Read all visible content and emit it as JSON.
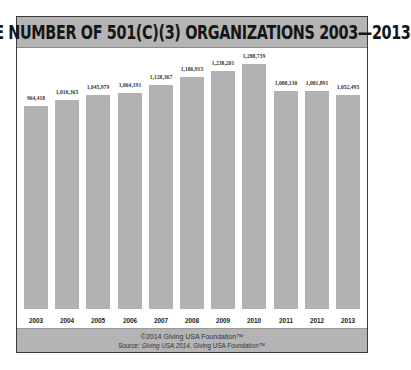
{
  "title": "THE NUMBER OF 501(C)(3) ORGANIZATIONS 2003—2013",
  "footer": {
    "copyright": "©2014 Giving USA Foundation™",
    "source_prefix": "Source: ",
    "source_italic": "Giving USA 2014",
    "source_suffix": ", Giving USA Foundation™"
  },
  "colors": {
    "bar": "#b2b2b2",
    "band": "#b4b4b4",
    "border": "#3a3a3a"
  },
  "chart_data": {
    "type": "bar",
    "title": "THE NUMBER OF 501(C)(3) ORGANIZATIONS 2003—2013",
    "xlabel": "",
    "ylabel": "",
    "categories": [
      "2003",
      "2004",
      "2005",
      "2006",
      "2007",
      "2008",
      "2009",
      "2010",
      "2011",
      "2012",
      "2013"
    ],
    "values": [
      964418,
      1010365,
      1045979,
      1064191,
      1128367,
      1186915,
      1238201,
      1288739,
      1080130,
      1081891,
      1052495
    ],
    "labels": [
      "964,418",
      "1,010,365",
      "1,045,979",
      "1,064,191",
      "1,128,367",
      "1,186,915",
      "1,238,201",
      "1,288,739",
      "1,080,130",
      "1,081,891",
      "1,052,495"
    ],
    "grid": false,
    "legend": null
  }
}
